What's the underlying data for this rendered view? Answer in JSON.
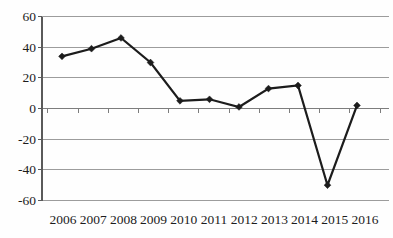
{
  "chart_data": {
    "type": "line",
    "title": "",
    "xlabel": "",
    "ylabel": "",
    "categories": [
      "2006",
      "2007",
      "2008",
      "2009",
      "2010",
      "2011",
      "2012",
      "2013",
      "2014",
      "2015",
      "2016"
    ],
    "series": [
      {
        "name": "",
        "values": [
          34,
          39,
          46,
          30,
          5,
          6,
          1,
          13,
          15,
          -50,
          2
        ]
      }
    ],
    "ylim": [
      -60,
      60
    ],
    "yticks": [
      60,
      40,
      20,
      0,
      -20,
      -40,
      -60
    ],
    "grid": true,
    "legend": false,
    "marker": "diamond",
    "colors": {
      "line": "#1c1c1c",
      "marker": "#1c1c1c",
      "gridline": "#9c9c9c",
      "zero_axis": "#7d7d7d",
      "y_axis": "#5a5a5a",
      "tick_label": "#1c1c1c",
      "background": "#fefefe"
    }
  }
}
